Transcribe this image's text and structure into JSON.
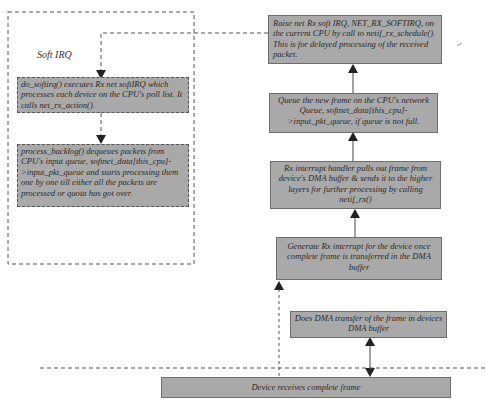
{
  "diagram": {
    "type": "flowchart",
    "title": "",
    "groups": [
      {
        "id": "softirq-group",
        "label": "Soft IRQ",
        "style": "dashed"
      }
    ],
    "nodes": {
      "raise_softirq": "Raise net Rx soft IRQ, NET_RX_SOFTIRQ, on the current CPU by call to netif_rx_schedule(). This is for delayed processing of the received packet.",
      "queue_frame": "Queue the new frame on the CPU's network Queue, softnet_data[this_cpu]->input_pkt_queue, if queue is not full.",
      "rx_handler": "Rx interrupt handler pulls out frame  from device's DMA buffer & sends it to the higher layers for further processing by calling netif_rx()",
      "generate_interrupt": "Generate Rx interrupt for the device  once complete frame is transferred in the DMA buffer",
      "dma_transfer": "Does DMA transfer of the frame in devices DMA buffer",
      "device_receives": "Device receives complete frame",
      "do_softirq": "do_softirq() executes Rx net softIRQ which processes each device on the CPU's poll list. It calls net_rx_action().",
      "process_backlog": "process_backlog() dequeues packets from CPU's input queue, softnet_data[this_cpu]->input_pkt_queue and starts processing them one by one till either all the packets are processed or quota has got over."
    },
    "edges": [
      {
        "from": "device_receives",
        "to": "dma_transfer",
        "style": "solid",
        "arrow": "both"
      },
      {
        "from": "device_receives",
        "to": "generate_interrupt",
        "style": "dashed",
        "arrow": "end"
      },
      {
        "from": "generate_interrupt",
        "to": "rx_handler",
        "style": "solid",
        "arrow": "end"
      },
      {
        "from": "rx_handler",
        "to": "queue_frame",
        "style": "solid",
        "arrow": "end"
      },
      {
        "from": "queue_frame",
        "to": "raise_softirq",
        "style": "solid",
        "arrow": "end"
      },
      {
        "from": "raise_softirq",
        "to": "do_softirq",
        "style": "dashed",
        "arrow": "end"
      },
      {
        "from": "do_softirq",
        "to": "process_backlog",
        "style": "dashed",
        "arrow": "end"
      }
    ],
    "colors": {
      "box_fill": "#a9a9a9",
      "line": "#444444",
      "text": "#2a2a2a"
    }
  }
}
